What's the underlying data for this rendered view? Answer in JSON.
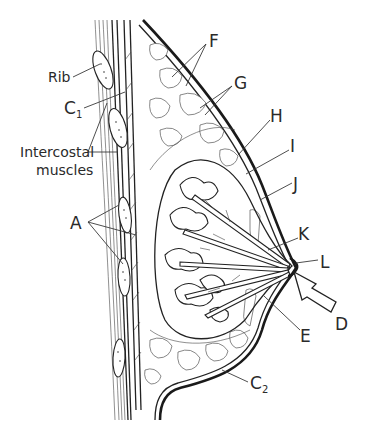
{
  "figure": {
    "labels": {
      "rib": "Rib",
      "c1_main": "C",
      "c1_sub": "1",
      "intercostal_line1": "Intercostal",
      "intercostal_line2": "muscles",
      "a": "A",
      "f": "F",
      "g": "G",
      "h": "H",
      "i": "I",
      "j": "J",
      "k": "K",
      "l": "L",
      "d": "D",
      "e": "E",
      "c2_main": "C",
      "c2_sub": "2"
    }
  }
}
